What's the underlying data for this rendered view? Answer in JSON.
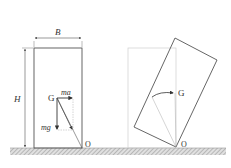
{
  "diagram": {
    "left_block": {
      "width_label": "B",
      "height_label": "H",
      "center_label": "G",
      "inertial_force_label": "ma",
      "gravity_label": "mg",
      "pivot_label": "O"
    },
    "right_block": {
      "center_label": "G",
      "pivot_label": "O"
    },
    "colors": {
      "line": "#555555",
      "ghost": "#c8c8c8",
      "ground": "#b0b0b0"
    }
  }
}
